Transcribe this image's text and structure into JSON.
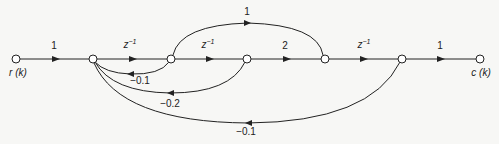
{
  "diagram": {
    "type": "signal-flow-graph",
    "nodes": [
      {
        "id": "n0",
        "label": "r(k)"
      },
      {
        "id": "n1",
        "label": ""
      },
      {
        "id": "n2",
        "label": ""
      },
      {
        "id": "n3",
        "label": ""
      },
      {
        "id": "n4",
        "label": ""
      },
      {
        "id": "n5",
        "label": ""
      },
      {
        "id": "n6",
        "label": "c(k)"
      }
    ],
    "branches": [
      {
        "from": "n0",
        "to": "n1",
        "gain": "1"
      },
      {
        "from": "n1",
        "to": "n2",
        "gain": "z",
        "exp": "−1"
      },
      {
        "from": "n2",
        "to": "n3",
        "gain": "z",
        "exp": "−1"
      },
      {
        "from": "n3",
        "to": "n4",
        "gain": "2"
      },
      {
        "from": "n4",
        "to": "n5",
        "gain": "z",
        "exp": "−1"
      },
      {
        "from": "n5",
        "to": "n6",
        "gain": "1"
      },
      {
        "from": "n2",
        "to": "n4",
        "gain": "1"
      },
      {
        "from": "n2",
        "to": "n1",
        "gain": "−0.1"
      },
      {
        "from": "n3",
        "to": "n1",
        "gain": "−0.2"
      },
      {
        "from": "n5",
        "to": "n1",
        "gain": "−0.1"
      }
    ],
    "input_label": "r (k)",
    "output_label": "c (k)"
  }
}
